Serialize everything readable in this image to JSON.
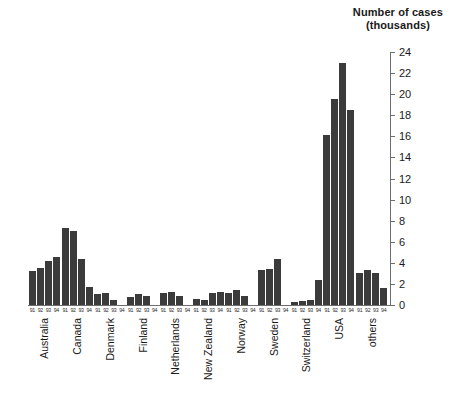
{
  "chart": {
    "title_line1": "Number of cases",
    "title_line2": "(thousands)",
    "bar_color": "#3b3b3b",
    "axis_color": "#6e6e6e"
  },
  "chart_data": {
    "type": "bar",
    "title": "Number of cases (thousands)",
    "xlabel": "",
    "ylabel": "Number of cases (thousands)",
    "ylim": [
      0,
      24
    ],
    "yticks": [
      0,
      2,
      4,
      6,
      8,
      10,
      12,
      14,
      16,
      18,
      20,
      22,
      24
    ],
    "grid": false,
    "legend": "none",
    "categories": [
      "Australia",
      "Canada",
      "Denmark",
      "Finland",
      "Netherlands",
      "New Zealand",
      "Norway",
      "Sweden",
      "Switzerland",
      "USA",
      "others"
    ],
    "subcategories": [
      "91",
      "92",
      "93",
      "94"
    ],
    "series": [
      {
        "name": "91",
        "values": [
          3.2,
          7.3,
          1.0,
          0.8,
          1.1,
          0.6,
          1.1,
          3.3,
          0.3,
          16.1,
          3.0
        ]
      },
      {
        "name": "92",
        "values": [
          3.5,
          7.0,
          1.1,
          1.0,
          1.2,
          0.5,
          1.4,
          3.4,
          0.4,
          19.5,
          3.3
        ]
      },
      {
        "name": "93",
        "values": [
          4.2,
          4.4,
          0.5,
          0.9,
          0.9,
          1.1,
          0.9,
          4.4,
          0.5,
          23.0,
          3.0
        ]
      },
      {
        "name": "94",
        "values": [
          4.6,
          1.7,
          0.0,
          0.0,
          0.0,
          1.2,
          0.0,
          0.0,
          2.4,
          18.5,
          1.6
        ]
      }
    ]
  }
}
